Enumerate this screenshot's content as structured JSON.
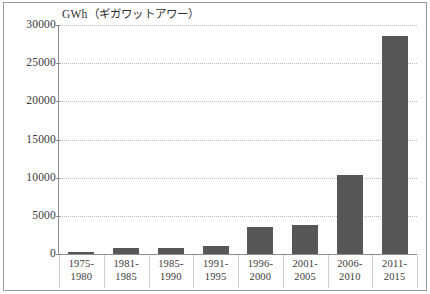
{
  "chart_data": {
    "type": "bar",
    "title": "",
    "ylabel": "GWh（ギガワットアワー）",
    "xlabel": "",
    "ylim": [
      0,
      30000
    ],
    "ytick_values": [
      0,
      5000,
      10000,
      15000,
      20000,
      25000,
      30000
    ],
    "ytick_labels": [
      "0",
      "5000",
      "10000",
      "15000",
      "20000",
      "25000",
      "30000"
    ],
    "grid": true,
    "legend": "none",
    "bar_color": "#575757",
    "categories": [
      "1975-1980",
      "1981-1985",
      "1985-1990",
      "1991-1995",
      "1996-2000",
      "2001-2005",
      "2006-2010",
      "2011-2015"
    ],
    "category_lines": [
      [
        "1975-",
        "1980"
      ],
      [
        "1981-",
        "1985"
      ],
      [
        "1985-",
        "1990"
      ],
      [
        "1991-",
        "1995"
      ],
      [
        "1996-",
        "2000"
      ],
      [
        "2001-",
        "2005"
      ],
      [
        "2006-",
        "2010"
      ],
      [
        "2011-",
        "2015"
      ]
    ],
    "values": [
      300,
      800,
      800,
      1000,
      3500,
      3800,
      10400,
      28500
    ]
  },
  "axis": {
    "y_title": "GWh（ギガワットアワー）"
  }
}
